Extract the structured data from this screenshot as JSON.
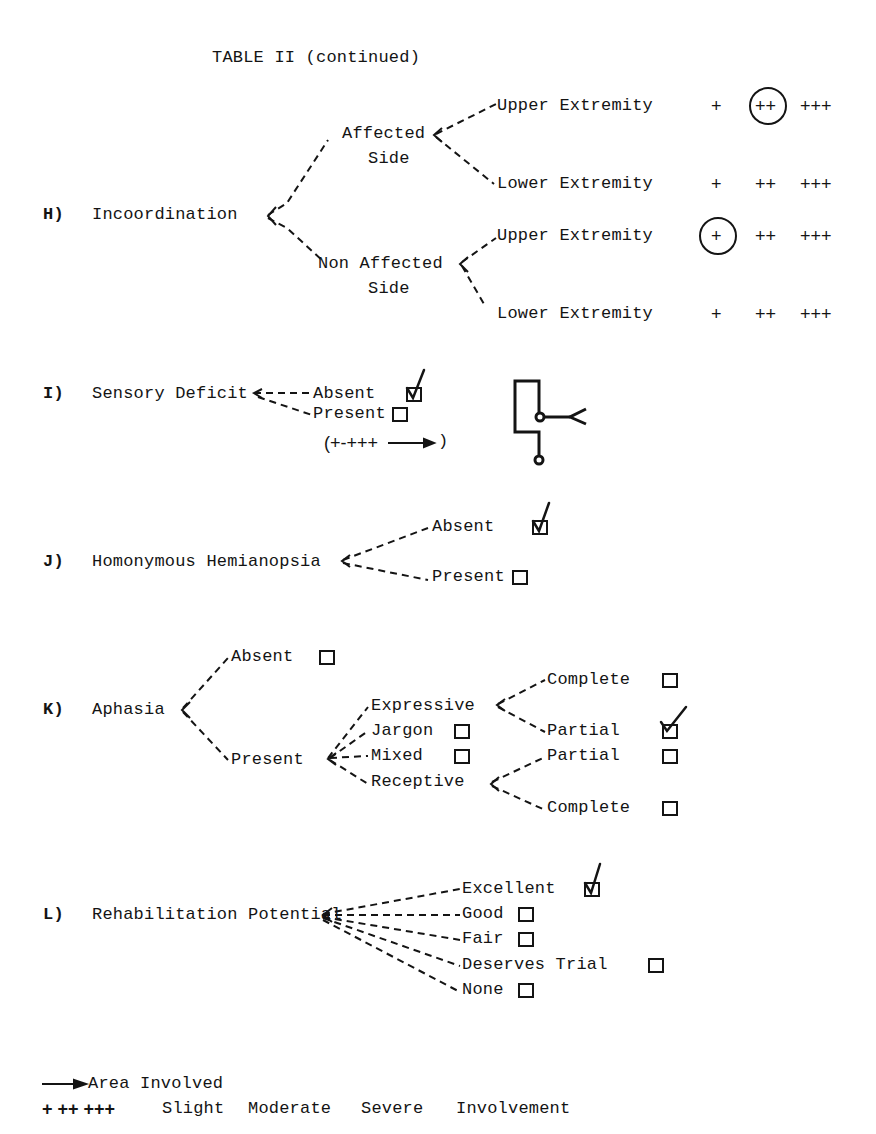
{
  "title": "TABLE II (continued)",
  "sections": {
    "H": {
      "letter": "H)",
      "label": "Incoordination",
      "branches": [
        {
          "label_line1": "Affected",
          "label_line2": "Side",
          "items": [
            {
              "label": "Upper Extremity",
              "scale": [
                "+",
                "++",
                "+++"
              ],
              "selected": "++"
            },
            {
              "label": "Lower Extremity",
              "scale": [
                "+",
                "++",
                "+++"
              ],
              "selected": null
            }
          ]
        },
        {
          "label_line1": "Non Affected",
          "label_line2": "Side",
          "items": [
            {
              "label": "Upper Extremity",
              "scale": [
                "+",
                "++",
                "+++"
              ],
              "selected": "+"
            },
            {
              "label": "Lower Extremity",
              "scale": [
                "+",
                "++",
                "+++"
              ],
              "selected": null
            }
          ]
        }
      ]
    },
    "I": {
      "letter": "I)",
      "label": "Sensory Deficit",
      "options": [
        {
          "label": "Absent",
          "checked": true
        },
        {
          "label": "Present",
          "checked": false
        }
      ],
      "range_note": "(+-+++",
      "range_close": ")"
    },
    "J": {
      "letter": "J)",
      "label": "Homonymous Hemianopsia",
      "options": [
        {
          "label": "Absent",
          "checked": true
        },
        {
          "label": "Present",
          "checked": false
        }
      ]
    },
    "K": {
      "letter": "K)",
      "label": "Aphasia",
      "absent": {
        "label": "Absent",
        "checked": false
      },
      "present": {
        "label": "Present",
        "expressive": {
          "label": "Expressive",
          "options": [
            {
              "label": "Complete",
              "checked": false
            },
            {
              "label": "Partial",
              "checked": true
            }
          ]
        },
        "jargon": {
          "label": "Jargon",
          "checked": false
        },
        "mixed": {
          "label": "Mixed",
          "checked": false
        },
        "receptive": {
          "label": "Receptive",
          "options": [
            {
              "label": "Partial",
              "checked": false
            },
            {
              "label": "Complete",
              "checked": false
            }
          ]
        }
      }
    },
    "L": {
      "letter": "L)",
      "label": "Rehabilitation Potential",
      "options": [
        {
          "label": "Excellent",
          "checked": true
        },
        {
          "label": "Good",
          "checked": false
        },
        {
          "label": "Fair",
          "checked": false
        },
        {
          "label": "Deserves Trial",
          "checked": false
        },
        {
          "label": "None",
          "checked": false
        }
      ]
    }
  },
  "legend": {
    "arrow_label": "Area Involved",
    "scale_symbols": "+ ++ +++",
    "scale_words": [
      "Slight",
      "Moderate",
      "Severe",
      "Involvement"
    ]
  }
}
